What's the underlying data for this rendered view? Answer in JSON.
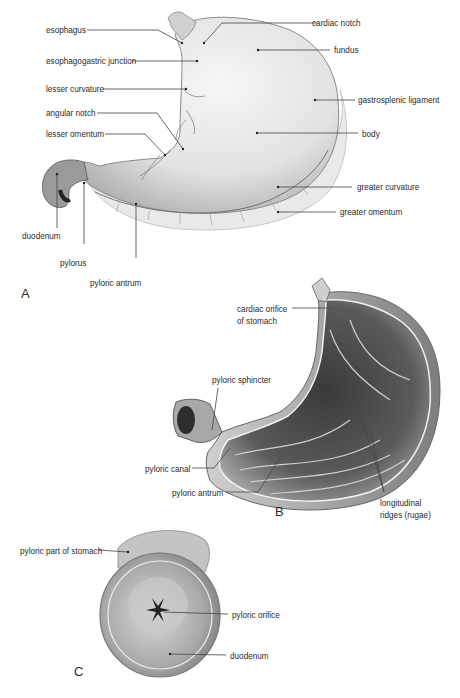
{
  "figure": {
    "panels": [
      {
        "id": "A",
        "letter": "A",
        "labels": [
          {
            "text": "esophagus"
          },
          {
            "text": "esophagogastric junction"
          },
          {
            "text": "lesser curvature"
          },
          {
            "text": "angular notch"
          },
          {
            "text": "lesser omentum"
          },
          {
            "text": "duodenum"
          },
          {
            "text": "pylorus"
          },
          {
            "text": "pyloric antrum"
          },
          {
            "text": "cardiac notch"
          },
          {
            "text": "fundus"
          },
          {
            "text": "gastrosplenic ligament"
          },
          {
            "text": "body"
          },
          {
            "text": "greater curvature"
          },
          {
            "text": "greater omentum"
          }
        ]
      },
      {
        "id": "B",
        "letter": "B",
        "labels": [
          {
            "text": "cardiac orifice"
          },
          {
            "text": "of stomach"
          },
          {
            "text": "pyloric sphincter"
          },
          {
            "text": "pyloric canal"
          },
          {
            "text": "pyloric antrum"
          },
          {
            "text": "longitudinal"
          },
          {
            "text": "ridges (rugae)"
          }
        ]
      },
      {
        "id": "C",
        "letter": "C",
        "labels": [
          {
            "text": "pyloric part of stomach"
          },
          {
            "text": "pyloric orifice"
          },
          {
            "text": "duodenum"
          }
        ]
      }
    ]
  }
}
